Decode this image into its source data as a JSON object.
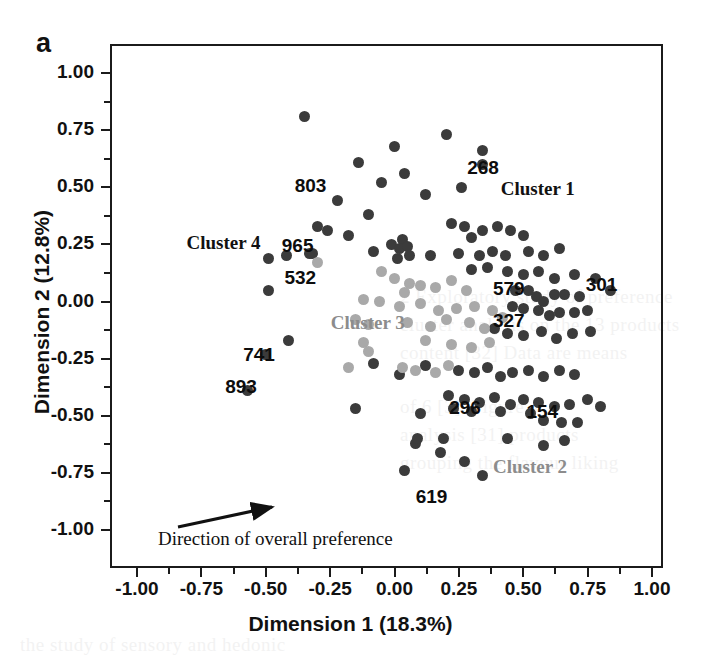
{
  "panel": {
    "letter": "a"
  },
  "axes": {
    "x_title": "Dimension  1 (18.3%)",
    "y_title": "Dimension 2 (12.8%)",
    "x_ticks": [
      "-1.00",
      "-0.75",
      "-0.50",
      "-0.25",
      "0.00",
      "0.25",
      "0.50",
      "0.75",
      "1.00"
    ],
    "y_ticks": [
      "1.00",
      "0.75",
      "0.50",
      "0.25",
      "0.00",
      "-0.25",
      "-0.50",
      "-0.75",
      "-1.00"
    ],
    "x_tick_values": [
      -1.0,
      -0.75,
      -0.5,
      -0.25,
      0.0,
      0.25,
      0.5,
      0.75,
      1.0
    ],
    "y_tick_values": [
      1.0,
      0.75,
      0.5,
      0.25,
      0.0,
      -0.25,
      -0.5,
      -0.75,
      -1.0
    ]
  },
  "annotation": {
    "arrow_label": "Direction of  overall preference"
  },
  "cluster_labels": [
    {
      "text": "Cluster 1",
      "x": 0.56,
      "y": 0.49,
      "color": "#111111"
    },
    {
      "text": "Cluster 2",
      "x": 0.53,
      "y": -0.73,
      "color": "#8c8c8c"
    },
    {
      "text": "Cluster 3",
      "x": -0.1,
      "y": -0.1,
      "color": "#8c8c8c"
    },
    {
      "text": "Cluster 4",
      "x": -0.66,
      "y": 0.25,
      "color": "#111111"
    }
  ],
  "point_labels": [
    {
      "text": "803",
      "x": -0.31,
      "y": 0.5
    },
    {
      "text": "965",
      "x": -0.36,
      "y": 0.24
    },
    {
      "text": "532",
      "x": -0.35,
      "y": 0.1
    },
    {
      "text": "268",
      "x": 0.36,
      "y": 0.58
    },
    {
      "text": "301",
      "x": 0.82,
      "y": 0.07
    },
    {
      "text": "579",
      "x": 0.46,
      "y": 0.05
    },
    {
      "text": "327",
      "x": 0.46,
      "y": -0.09
    },
    {
      "text": "741",
      "x": -0.51,
      "y": -0.24
    },
    {
      "text": "893",
      "x": -0.58,
      "y": -0.38
    },
    {
      "text": "296",
      "x": 0.29,
      "y": -0.47
    },
    {
      "text": "154",
      "x": 0.59,
      "y": -0.49
    },
    {
      "text": "619",
      "x": 0.16,
      "y": -0.86
    }
  ],
  "chart_data": {
    "type": "scatter",
    "title": "",
    "xlabel": "Dimension  1 (18.3%)",
    "ylabel": "Dimension 2 (12.8%)",
    "xlim": [
      -1.08,
      1.04
    ],
    "ylim": [
      -1.17,
      1.12
    ],
    "grid": false,
    "legend": "none",
    "series": [
      {
        "name": "dark-points",
        "color": "#3b3b3b",
        "points": [
          [
            -0.35,
            0.81
          ],
          [
            -0.22,
            0.44
          ],
          [
            -0.14,
            0.61
          ],
          [
            -0.26,
            0.31
          ],
          [
            -0.1,
            0.38
          ],
          [
            -0.05,
            0.52
          ],
          [
            0.0,
            0.68
          ],
          [
            0.04,
            0.56
          ],
          [
            0.12,
            0.47
          ],
          [
            0.2,
            0.73
          ],
          [
            0.26,
            0.5
          ],
          [
            0.34,
            0.66
          ],
          [
            0.34,
            0.6
          ],
          [
            -0.49,
            0.19
          ],
          [
            -0.42,
            0.2
          ],
          [
            -0.33,
            0.21
          ],
          [
            -0.32,
            0.21
          ],
          [
            -0.3,
            0.33
          ],
          [
            -0.49,
            0.05
          ],
          [
            -0.18,
            0.29
          ],
          [
            -0.08,
            0.22
          ],
          [
            -0.01,
            0.25
          ],
          [
            0.03,
            0.27
          ],
          [
            0.02,
            0.23
          ],
          [
            0.05,
            0.24
          ],
          [
            0.06,
            0.2
          ],
          [
            0.01,
            0.19
          ],
          [
            0.14,
            0.2
          ],
          [
            0.22,
            0.34
          ],
          [
            0.27,
            0.33
          ],
          [
            0.3,
            0.28
          ],
          [
            0.34,
            0.31
          ],
          [
            0.4,
            0.33
          ],
          [
            0.45,
            0.31
          ],
          [
            0.5,
            0.29
          ],
          [
            0.25,
            0.21
          ],
          [
            0.33,
            0.2
          ],
          [
            0.38,
            0.22
          ],
          [
            0.43,
            0.2
          ],
          [
            0.52,
            0.22
          ],
          [
            0.58,
            0.2
          ],
          [
            0.64,
            0.23
          ],
          [
            0.3,
            0.14
          ],
          [
            0.36,
            0.15
          ],
          [
            0.44,
            0.13
          ],
          [
            0.5,
            0.12
          ],
          [
            0.56,
            0.13
          ],
          [
            0.62,
            0.1
          ],
          [
            0.7,
            0.12
          ],
          [
            0.78,
            0.1
          ],
          [
            0.47,
            0.05
          ],
          [
            0.52,
            0.05
          ],
          [
            0.55,
            0.02
          ],
          [
            0.58,
            0.0
          ],
          [
            0.62,
            0.03
          ],
          [
            0.66,
            0.03
          ],
          [
            0.72,
            0.02
          ],
          [
            0.84,
            0.05
          ],
          [
            0.46,
            -0.02
          ],
          [
            0.5,
            -0.03
          ],
          [
            0.56,
            -0.04
          ],
          [
            0.6,
            -0.06
          ],
          [
            0.64,
            -0.05
          ],
          [
            0.7,
            -0.05
          ],
          [
            0.75,
            -0.04
          ],
          [
            -0.5,
            -0.23
          ],
          [
            -0.57,
            -0.39
          ],
          [
            -0.41,
            -0.17
          ],
          [
            0.39,
            -0.12
          ],
          [
            0.44,
            -0.14
          ],
          [
            0.5,
            -0.15
          ],
          [
            0.57,
            -0.13
          ],
          [
            0.63,
            -0.16
          ],
          [
            0.69,
            -0.14
          ],
          [
            0.76,
            -0.13
          ],
          [
            -0.08,
            -0.27
          ],
          [
            0.02,
            -0.32
          ],
          [
            0.12,
            -0.28
          ],
          [
            0.25,
            -0.3
          ],
          [
            0.31,
            -0.31
          ],
          [
            0.36,
            -0.29
          ],
          [
            0.41,
            -0.33
          ],
          [
            0.46,
            -0.31
          ],
          [
            0.52,
            -0.3
          ],
          [
            0.58,
            -0.33
          ],
          [
            0.64,
            -0.3
          ],
          [
            0.7,
            -0.32
          ],
          [
            0.21,
            -0.41
          ],
          [
            0.27,
            -0.43
          ],
          [
            0.33,
            -0.44
          ],
          [
            0.39,
            -0.42
          ],
          [
            0.45,
            -0.45
          ],
          [
            0.5,
            -0.43
          ],
          [
            0.56,
            -0.44
          ],
          [
            0.62,
            -0.46
          ],
          [
            0.68,
            -0.45
          ],
          [
            0.75,
            -0.43
          ],
          [
            -0.15,
            -0.47
          ],
          [
            0.1,
            -0.49
          ],
          [
            0.23,
            -0.47
          ],
          [
            0.3,
            -0.48
          ],
          [
            0.41,
            -0.48
          ],
          [
            0.53,
            -0.49
          ],
          [
            0.58,
            -0.52
          ],
          [
            0.65,
            -0.53
          ],
          [
            0.71,
            -0.53
          ],
          [
            0.8,
            -0.46
          ],
          [
            0.08,
            -0.62
          ],
          [
            0.09,
            -0.6
          ],
          [
            0.19,
            -0.6
          ],
          [
            0.18,
            -0.66
          ],
          [
            0.04,
            -0.74
          ],
          [
            0.44,
            -0.6
          ],
          [
            0.58,
            -0.63
          ],
          [
            0.66,
            -0.61
          ],
          [
            0.27,
            -0.7
          ],
          [
            0.34,
            -0.76
          ]
        ]
      },
      {
        "name": "light-points",
        "color": "#a9a9a9",
        "points": [
          [
            -0.3,
            0.17
          ],
          [
            -0.05,
            0.13
          ],
          [
            0.0,
            0.1
          ],
          [
            0.06,
            0.08
          ],
          [
            0.04,
            0.04
          ],
          [
            0.1,
            0.07
          ],
          [
            0.16,
            0.06
          ],
          [
            0.22,
            0.09
          ],
          [
            0.28,
            0.05
          ],
          [
            -0.12,
            0.01
          ],
          [
            -0.06,
            0.0
          ],
          [
            0.02,
            -0.02
          ],
          [
            0.1,
            -0.01
          ],
          [
            0.17,
            -0.04
          ],
          [
            0.24,
            -0.03
          ],
          [
            0.31,
            -0.02
          ],
          [
            0.38,
            -0.04
          ],
          [
            -0.15,
            -0.08
          ],
          [
            -0.1,
            -0.1
          ],
          [
            0.05,
            -0.09
          ],
          [
            0.14,
            -0.11
          ],
          [
            0.2,
            -0.08
          ],
          [
            0.29,
            -0.09
          ],
          [
            0.35,
            -0.12
          ],
          [
            0.42,
            -0.07
          ],
          [
            -0.12,
            -0.18
          ],
          [
            -0.1,
            -0.22
          ],
          [
            0.12,
            -0.17
          ],
          [
            0.22,
            -0.19
          ],
          [
            0.3,
            -0.2
          ],
          [
            0.37,
            -0.18
          ],
          [
            -0.18,
            -0.29
          ],
          [
            0.03,
            -0.29
          ],
          [
            0.08,
            -0.3
          ],
          [
            0.16,
            -0.31
          ],
          [
            0.21,
            -0.28
          ]
        ]
      }
    ]
  }
}
